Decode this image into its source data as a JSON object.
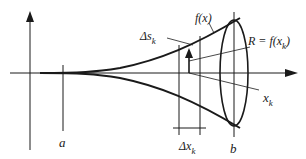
{
  "diagram": {
    "labels": {
      "a": "a",
      "b": "b",
      "fx": "f(x)",
      "delta_s_main": "Δs",
      "delta_s_sub": "k",
      "radius_main": "R = f(x",
      "radius_sub": "k",
      "radius_close": ")",
      "xk_main": "x",
      "xk_sub": "k",
      "delta_x_main": "Δx",
      "delta_x_sub": "k"
    },
    "colors": {
      "stroke": "#1a1a1a",
      "background": "#ffffff"
    }
  }
}
